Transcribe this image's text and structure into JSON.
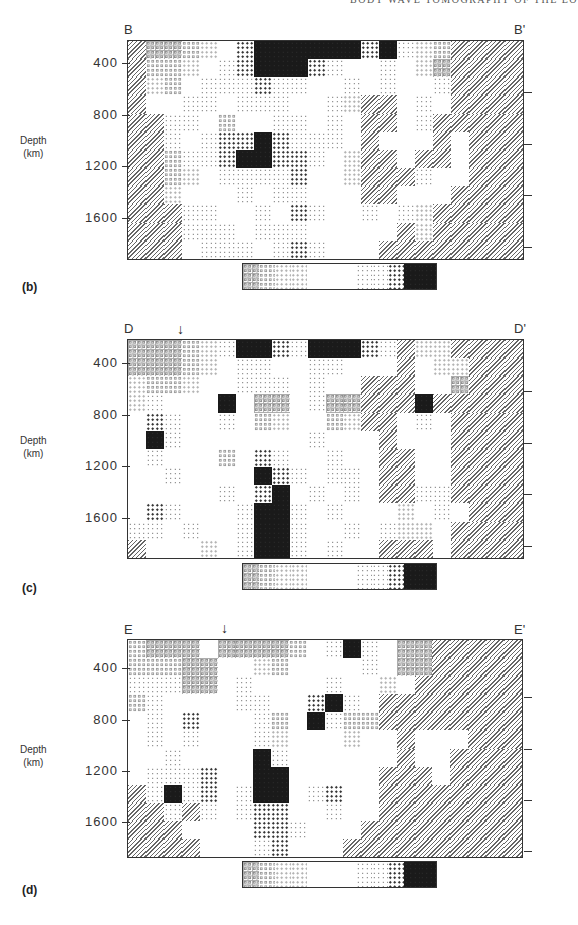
{
  "running_head": "BODY WAVE TOMOGRAPHY OF THE EO",
  "colorbar_classes": [
    "-3",
    "-2",
    "-1",
    "-1",
    "0",
    "0",
    "0",
    "1",
    "1",
    "2",
    "3",
    "3"
  ],
  "axis": {
    "ylabel_line1": "Depth",
    "ylabel_line2": "(km)",
    "ticks": [
      "400",
      "800",
      "1200",
      "1600"
    ]
  },
  "panels": [
    {
      "id": "b",
      "label": "(b)",
      "left_label": "B",
      "right_label": "B'",
      "arrow": null
    },
    {
      "id": "c",
      "label": "(c)",
      "left_label": "D",
      "right_label": "D'",
      "arrow": "↓"
    },
    {
      "id": "d",
      "label": "(d)",
      "left_label": "E",
      "right_label": "E'",
      "arrow": "↓"
    }
  ],
  "chart_data": [
    {
      "type": "heatmap",
      "title": "Cross-section B–B'",
      "panel_label": "(b)",
      "ylabel": "Depth (km)",
      "yticks": [
        400,
        800,
        1200,
        1600
      ],
      "ylim": [
        0,
        1700
      ],
      "legend": "colorbar: open-circle pattern (negative anomaly) → white (zero) → dark dots (positive anomaly); hatched = unresolved",
      "grid_cols": 22,
      "grid_rows": 12,
      "cells": [
        "H-3-3-2-1 0 2 3 3 3 3 3 3 2 3 1-1-2 H H H H",
        "H-2-2-1 0 1 2 3 3 3 2 1 0 0 1 0-1-3 H H H H",
        "H-1-2 0 1 1 1 2 1 1 0 0 1 0 1 0 0 1 H H H H",
        "H 0 0 1 1 0 1 1 1 0 0 1-1 H H 0 1 0 H H H H",
        "H H 1 1 0-2 0 0 1 1 0 1 0 H H 0 1 H H H H H",
        "H H 1 0 1 2 2 3 2 1 1 1 0 H 0 0 0 H 0 H H H",
        "H H-2 1 1 2 3 3 2 2 1 0-1 H H 0 H H 0 H H H",
        "H H-2-1 0 1 1 1 1 2 0 0-1 H H H 1 0 0 H H H",
        "H H-1 0 0 0 1 0 1 1 0 0 0 H H 0 0 0 H H H H",
        "H H H 1 1 0 0 1 0 2 1 0 0 1 0 1-1 H H H H H",
        "H H H 1 1 1 0 1 1 1 0 0 0 0 0 H-1 H H H H H",
        "H H H 0 1 1 1 0 1 2 1 0 0 0 H H H H H H H H"
      ]
    },
    {
      "type": "heatmap",
      "title": "Cross-section D–D'",
      "panel_label": "(c)",
      "ylabel": "Depth (km)",
      "yticks": [
        400,
        800,
        1200,
        1600
      ],
      "ylim": [
        0,
        1700
      ],
      "grid_cols": 22,
      "grid_rows": 12,
      "cells": [
        "-3-3-3-2-1 1 3 3 2 1 3 3 3 2 1 H-1-1 H H H H",
        "-3-3-3-2-1 0 1 1 0 0 1 1 0 0 0 H 0-1-1 H H H",
        "-1-2-2-1 0 0 1 1 1 0 1 0 0 H H H 0 0-3 H H H",
        "-1 1 0 0 0 3 0-3-3 0 1-3-3 H H H 3 H H H H H",
        " 0 2 1 0 0 1 0-2-1 0 0-2-1 H H 0 1 0 H H H H",
        " 0 3 1 0 0 0 0 0 0 0 1 0 0 0 H 0 0 0 H H H H",
        " 0 1 0 0 0-2 0 2 1 0 0 1 0 0 H H 0 0 H H H H",
        " 0 0 1 0 0 0 0 3 2 1 0 1 1 0 H H 0 0 H H H H",
        " 0 0 0 0 0 1 0 2 3 0 1 0 1 0 H H 1 1 H H H H",
        " 0 2 1 0 0 0 1 3 3 1 0 1 0 0 0-1 0 1 0 H H H",
        " 1 1 0 1 0 0 1 3 3 1 0 0 1 0 1-1-1 0 H H H H",
        " H 0 0 0-1 0 1 3 3 1 0 1 0 0 H H H 0 H H H H"
      ]
    },
    {
      "type": "heatmap",
      "title": "Cross-section E–E'",
      "panel_label": "(d)",
      "ylabel": "Depth (km)",
      "yticks": [
        400,
        800,
        1200,
        1600
      ],
      "ylim": [
        0,
        1700
      ],
      "grid_cols": 22,
      "grid_rows": 12,
      "cells": [
        "-2-3-3-3 0-3-3-3-3-2 0 1 3 1 0-3-3 H H H H H",
        "-2-2-2-3-3 0 0-1-2 0 0 0 0 1 0-3-3 H H H H H",
        " 1 1 1-3-3 0 1 0 0 0 0 1 0 0-1 0 H H H H H H",
        "-2 1 0 0 0 0 1 1 0 0 2 3 1 0 H H H H H H H H",
        " 0 1 0 2 0 0 0 1-2 0 3 1-2-2 H H H H H H H H",
        " 0 1 0 1 0 0 0 1-1 0 0 0-1 0 0 H 0 0 0 H H H",
        " 0 0 1 0 0 0 0 3 1 0 0 0 0 0 0 H 0 0 H H H H",
        " 0 1 1 1 2 0 0 3 3 0 0 0 0 0 H H H 0 H H H H",
        " H 1 3 1 2 0 1 3 3 0 1 2 0 0 H H H H H H H H",
        " H H 1 H 1 0 1 2 2 0 0 1 0 0 H H H H H H H H",
        " H H H 0 0 0 0 2 2 1 0 0 0 H H H H H H H H H",
        " H H H H 0 0 0 1 2 0 0 0 H H H H H H H H H H"
      ]
    }
  ]
}
